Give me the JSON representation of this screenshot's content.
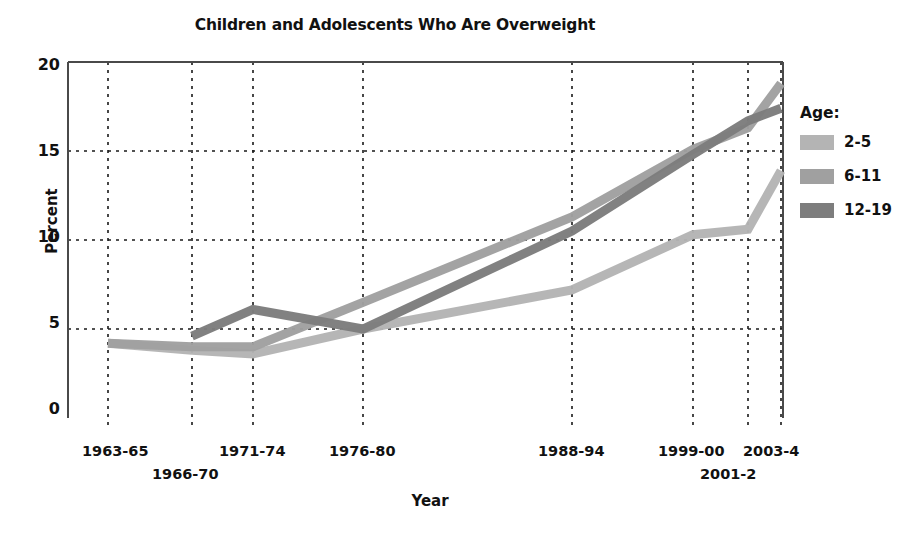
{
  "chart_data": {
    "type": "line",
    "title": "Children and Adolescents Who Are Overweight",
    "xlabel": "Year",
    "ylabel": "Percent",
    "ylim": [
      0,
      20
    ],
    "yticks": [
      0,
      5,
      10,
      15,
      20
    ],
    "grid": true,
    "legend_position": "right",
    "legend_title": "Age:",
    "categories": [
      "1963-65",
      "1966-70",
      "1971-74",
      "1976-80",
      "1988-94",
      "1999-00",
      "2001-2",
      "2003-4"
    ],
    "series": [
      {
        "name": "2-5",
        "color": "#b4b4b4",
        "values": [
          4.2,
          3.8,
          3.6,
          5.0,
          7.2,
          10.3,
          10.6,
          13.9
        ]
      },
      {
        "name": "6-11",
        "color": "#a0a0a0",
        "values": [
          4.2,
          4.0,
          4.0,
          6.5,
          11.3,
          15.1,
          16.3,
          18.8
        ]
      },
      {
        "name": "12-19",
        "color": "#7d7d7d",
        "values": [
          null,
          4.6,
          6.1,
          5.0,
          10.5,
          14.8,
          16.7,
          17.4
        ]
      }
    ]
  },
  "axis": {
    "ytick_labels": [
      "20",
      "15",
      "10",
      "5",
      "0"
    ],
    "xtick_labels": [
      "1963-65",
      "1966-70",
      "1971-74",
      "1976-80",
      "1988-94",
      "1999-00",
      "2001-2",
      "2003-4"
    ]
  },
  "legend": {
    "title": "Age:",
    "items": [
      {
        "label": "2-5",
        "color": "#b4b4b4"
      },
      {
        "label": "6-11",
        "color": "#a0a0a0"
      },
      {
        "label": "12-19",
        "color": "#7d7d7d"
      }
    ]
  }
}
